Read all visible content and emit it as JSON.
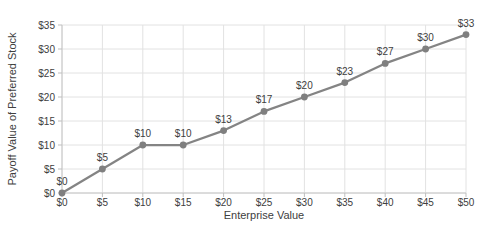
{
  "chart_data": {
    "type": "line",
    "title": "",
    "xlabel": "Enterprise Value",
    "ylabel": "Payoff Value of Preferred Stock",
    "x": [
      0,
      5,
      10,
      15,
      20,
      25,
      30,
      35,
      40,
      45,
      50
    ],
    "series": [
      {
        "name": "Payoff Value of Preferred Stock",
        "values": [
          0,
          5,
          10,
          10,
          13,
          17,
          20,
          23,
          27,
          30,
          33
        ],
        "data_labels": [
          "$0",
          "$5",
          "$10",
          "$10",
          "$13",
          "$17",
          "$20",
          "$23",
          "$27",
          "$30",
          "$33"
        ]
      }
    ],
    "x_ticks": [
      0,
      5,
      10,
      15,
      20,
      25,
      30,
      35,
      40,
      45,
      50
    ],
    "x_tick_labels": [
      "$0",
      "$5",
      "$10",
      "$15",
      "$20",
      "$25",
      "$30",
      "$35",
      "$40",
      "$45",
      "$50"
    ],
    "y_ticks": [
      0,
      5,
      10,
      15,
      20,
      25,
      30,
      35
    ],
    "y_tick_labels": [
      "$0",
      "$5",
      "$10",
      "$15",
      "$20",
      "$25",
      "$30",
      "$35"
    ],
    "xlim": [
      0,
      50
    ],
    "ylim": [
      0,
      35
    ],
    "grid": true,
    "legend": "none",
    "colors": {
      "line": "#848484",
      "marker": "#7f7f7f",
      "gridline": "#e2e2e2",
      "axis_line": "#c6c6c6",
      "tick_mark": "#bfbfbf",
      "text": "#404040",
      "background": "#ffffff"
    }
  }
}
